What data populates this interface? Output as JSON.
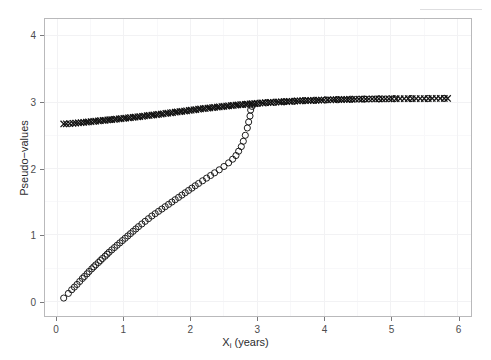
{
  "chart_data": {
    "type": "scatter",
    "title": "",
    "xlabel": "Xᵢ (years)",
    "xlabel_base": "X",
    "xlabel_sub": "i",
    "xlabel_tail": " (years)",
    "ylabel": "Pseudo−values",
    "xlim": [
      -0.18,
      6.2
    ],
    "ylim": [
      -0.22,
      4.25
    ],
    "xticks": [
      0,
      1,
      2,
      3,
      4,
      5,
      6
    ],
    "xticklabels": [
      "0",
      "1",
      "2",
      "3",
      "4",
      "5",
      "6"
    ],
    "yticks": [
      0,
      1,
      2,
      3,
      4
    ],
    "yticklabels": [
      "0",
      "1",
      "2",
      "3",
      "4"
    ],
    "grid": true,
    "grid_minor": true,
    "grid_color": "#f2f2f4",
    "grid_minor_color": "#f8f8fa",
    "panel_border_color": "#b9b9bb",
    "background": "#ffffff",
    "legend": null,
    "legend_position": "none",
    "marker_color": "#111111",
    "series": [
      {
        "name": "upper-curve-x-markers",
        "marker": "x",
        "color": "#111111",
        "points": [
          [
            0.1,
            2.67
          ],
          [
            0.14,
            2.672
          ],
          [
            0.19,
            2.676
          ],
          [
            0.24,
            2.68
          ],
          [
            0.28,
            2.684
          ],
          [
            0.32,
            2.687
          ],
          [
            0.36,
            2.69
          ],
          [
            0.4,
            2.694
          ],
          [
            0.44,
            2.698
          ],
          [
            0.47,
            2.701
          ],
          [
            0.51,
            2.705
          ],
          [
            0.55,
            2.709
          ],
          [
            0.58,
            2.712
          ],
          [
            0.62,
            2.716
          ],
          [
            0.65,
            2.719
          ],
          [
            0.69,
            2.723
          ],
          [
            0.72,
            2.726
          ],
          [
            0.76,
            2.73
          ],
          [
            0.79,
            2.734
          ],
          [
            0.82,
            2.737
          ],
          [
            0.86,
            2.741
          ],
          [
            0.89,
            2.744
          ],
          [
            0.93,
            2.748
          ],
          [
            0.96,
            2.751
          ],
          [
            1.0,
            2.755
          ],
          [
            1.03,
            2.758
          ],
          [
            1.07,
            2.762
          ],
          [
            1.1,
            2.766
          ],
          [
            1.14,
            2.77
          ],
          [
            1.17,
            2.774
          ],
          [
            1.21,
            2.778
          ],
          [
            1.24,
            2.782
          ],
          [
            1.28,
            2.786
          ],
          [
            1.31,
            2.79
          ],
          [
            1.35,
            2.794
          ],
          [
            1.38,
            2.798
          ],
          [
            1.42,
            2.802
          ],
          [
            1.45,
            2.806
          ],
          [
            1.49,
            2.811
          ],
          [
            1.52,
            2.815
          ],
          [
            1.56,
            2.82
          ],
          [
            1.59,
            2.824
          ],
          [
            1.63,
            2.829
          ],
          [
            1.66,
            2.833
          ],
          [
            1.7,
            2.838
          ],
          [
            1.73,
            2.842
          ],
          [
            1.77,
            2.847
          ],
          [
            1.8,
            2.851
          ],
          [
            1.84,
            2.856
          ],
          [
            1.87,
            2.86
          ],
          [
            1.91,
            2.865
          ],
          [
            1.94,
            2.869
          ],
          [
            1.98,
            2.874
          ],
          [
            2.01,
            2.878
          ],
          [
            2.05,
            2.883
          ],
          [
            2.08,
            2.887
          ],
          [
            2.12,
            2.892
          ],
          [
            2.15,
            2.896
          ],
          [
            2.19,
            2.9
          ],
          [
            2.22,
            2.904
          ],
          [
            2.26,
            2.908
          ],
          [
            2.29,
            2.912
          ],
          [
            2.33,
            2.916
          ],
          [
            2.36,
            2.92
          ],
          [
            2.4,
            2.924
          ],
          [
            2.43,
            2.928
          ],
          [
            2.47,
            2.932
          ],
          [
            2.5,
            2.936
          ],
          [
            2.54,
            2.94
          ],
          [
            2.57,
            2.943
          ],
          [
            2.61,
            2.947
          ],
          [
            2.64,
            2.95
          ],
          [
            2.68,
            2.954
          ],
          [
            2.71,
            2.957
          ],
          [
            2.75,
            2.96
          ],
          [
            2.78,
            2.963
          ],
          [
            2.82,
            2.966
          ],
          [
            2.85,
            2.969
          ],
          [
            2.89,
            2.972
          ],
          [
            2.92,
            2.975
          ],
          [
            2.96,
            2.978
          ],
          [
            3.0,
            2.981
          ],
          [
            3.04,
            2.984
          ],
          [
            3.08,
            2.987
          ],
          [
            3.12,
            2.99
          ],
          [
            3.16,
            2.992
          ],
          [
            3.2,
            2.995
          ],
          [
            3.24,
            2.997
          ],
          [
            3.28,
            3.0
          ],
          [
            3.32,
            3.002
          ],
          [
            3.36,
            3.004
          ],
          [
            3.4,
            3.006
          ],
          [
            3.44,
            3.008
          ],
          [
            3.48,
            3.01
          ],
          [
            3.52,
            3.012
          ],
          [
            3.56,
            3.014
          ],
          [
            3.6,
            3.016
          ],
          [
            3.64,
            3.018
          ],
          [
            3.68,
            3.02
          ],
          [
            3.72,
            3.021
          ],
          [
            3.76,
            3.023
          ],
          [
            3.8,
            3.024
          ],
          [
            3.84,
            3.026
          ],
          [
            3.88,
            3.027
          ],
          [
            3.92,
            3.029
          ],
          [
            3.96,
            3.03
          ],
          [
            4.0,
            3.031
          ],
          [
            4.05,
            3.033
          ],
          [
            4.1,
            3.034
          ],
          [
            4.14,
            3.035
          ],
          [
            4.18,
            3.036
          ],
          [
            4.22,
            3.037
          ],
          [
            4.26,
            3.038
          ],
          [
            4.3,
            3.039
          ],
          [
            4.34,
            3.04
          ],
          [
            4.38,
            3.041
          ],
          [
            4.42,
            3.042
          ],
          [
            4.47,
            3.043
          ],
          [
            4.52,
            3.044
          ],
          [
            4.57,
            3.045
          ],
          [
            4.62,
            3.045
          ],
          [
            4.67,
            3.046
          ],
          [
            4.72,
            3.047
          ],
          [
            4.77,
            3.047
          ],
          [
            4.82,
            3.048
          ],
          [
            4.87,
            3.048
          ],
          [
            4.92,
            3.049
          ],
          [
            4.97,
            3.049
          ],
          [
            5.02,
            3.05
          ],
          [
            5.08,
            3.05
          ],
          [
            5.14,
            3.051
          ],
          [
            5.2,
            3.051
          ],
          [
            5.26,
            3.052
          ],
          [
            5.32,
            3.052
          ],
          [
            5.38,
            3.052
          ],
          [
            5.44,
            3.053
          ],
          [
            5.5,
            3.053
          ],
          [
            5.56,
            3.053
          ],
          [
            5.62,
            3.054
          ],
          [
            5.68,
            3.054
          ],
          [
            5.74,
            3.054
          ],
          [
            5.8,
            3.055
          ],
          [
            5.85,
            3.055
          ]
        ]
      },
      {
        "name": "lower-curve-o-markers",
        "marker": "o",
        "color": "#111111",
        "points": [
          [
            0.1,
            0.05
          ],
          [
            0.17,
            0.12
          ],
          [
            0.22,
            0.175
          ],
          [
            0.26,
            0.215
          ],
          [
            0.3,
            0.255
          ],
          [
            0.34,
            0.3
          ],
          [
            0.38,
            0.345
          ],
          [
            0.41,
            0.375
          ],
          [
            0.45,
            0.415
          ],
          [
            0.48,
            0.45
          ],
          [
            0.52,
            0.49
          ],
          [
            0.55,
            0.52
          ],
          [
            0.58,
            0.55
          ],
          [
            0.62,
            0.585
          ],
          [
            0.65,
            0.615
          ],
          [
            0.68,
            0.645
          ],
          [
            0.72,
            0.68
          ],
          [
            0.75,
            0.71
          ],
          [
            0.78,
            0.74
          ],
          [
            0.82,
            0.775
          ],
          [
            0.86,
            0.81
          ],
          [
            0.9,
            0.845
          ],
          [
            0.94,
            0.88
          ],
          [
            0.98,
            0.915
          ],
          [
            1.02,
            0.95
          ],
          [
            1.06,
            0.985
          ],
          [
            1.1,
            1.02
          ],
          [
            1.14,
            1.055
          ],
          [
            1.18,
            1.09
          ],
          [
            1.22,
            1.125
          ],
          [
            1.27,
            1.165
          ],
          [
            1.32,
            1.205
          ],
          [
            1.37,
            1.245
          ],
          [
            1.42,
            1.285
          ],
          [
            1.47,
            1.32
          ],
          [
            1.52,
            1.355
          ],
          [
            1.57,
            1.39
          ],
          [
            1.62,
            1.425
          ],
          [
            1.67,
            1.46
          ],
          [
            1.72,
            1.495
          ],
          [
            1.77,
            1.53
          ],
          [
            1.82,
            1.565
          ],
          [
            1.87,
            1.6
          ],
          [
            1.92,
            1.635
          ],
          [
            1.97,
            1.67
          ],
          [
            2.02,
            1.705
          ],
          [
            2.07,
            1.74
          ],
          [
            2.12,
            1.775
          ],
          [
            2.18,
            1.815
          ],
          [
            2.24,
            1.855
          ],
          [
            2.3,
            1.895
          ],
          [
            2.36,
            1.935
          ],
          [
            2.43,
            1.98
          ],
          [
            2.5,
            2.03
          ],
          [
            2.57,
            2.085
          ],
          [
            2.63,
            2.14
          ],
          [
            2.68,
            2.195
          ],
          [
            2.72,
            2.26
          ],
          [
            2.76,
            2.33
          ],
          [
            2.79,
            2.41
          ],
          [
            2.82,
            2.5
          ],
          [
            2.85,
            2.61
          ],
          [
            2.87,
            2.7
          ],
          [
            2.89,
            2.79
          ],
          [
            2.9,
            2.88
          ],
          [
            2.92,
            2.935
          ],
          [
            2.95,
            2.968
          ],
          [
            3.02,
            2.982
          ],
          [
            3.14,
            2.99
          ],
          [
            3.26,
            2.996
          ],
          [
            3.4,
            3.004
          ],
          [
            3.55,
            3.012
          ],
          [
            3.7,
            3.02
          ],
          [
            3.86,
            3.026
          ],
          [
            4.02,
            3.032
          ],
          [
            4.2,
            3.037
          ],
          [
            4.4,
            3.042
          ],
          [
            4.6,
            3.045
          ],
          [
            4.82,
            3.048
          ],
          [
            5.05,
            3.05
          ],
          [
            5.3,
            3.052
          ],
          [
            5.55,
            3.053
          ],
          [
            5.8,
            3.055
          ]
        ]
      }
    ]
  }
}
